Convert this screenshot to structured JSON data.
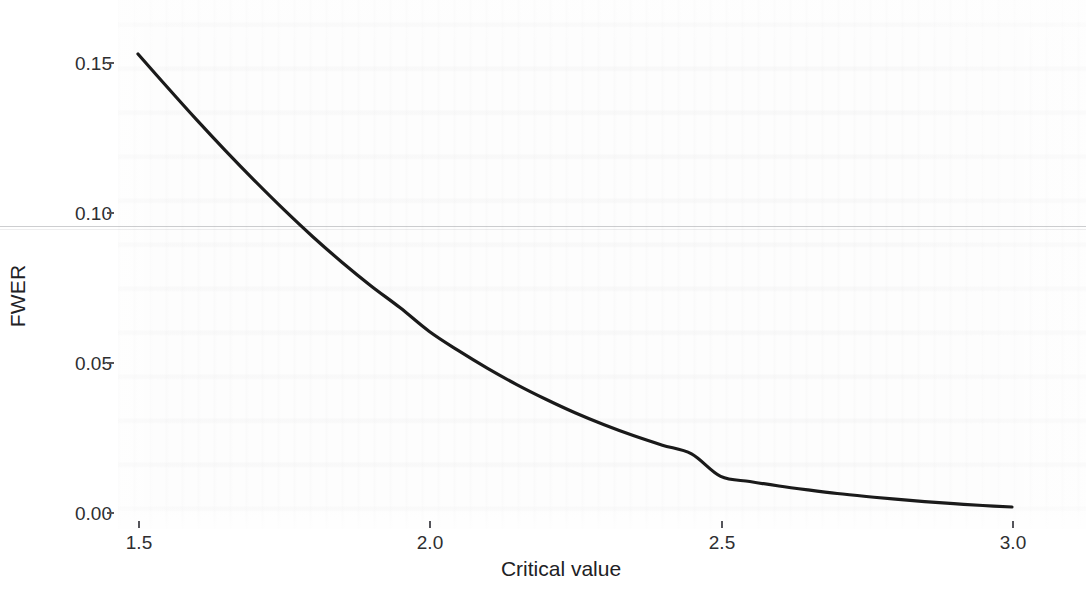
{
  "chart_data": {
    "type": "line",
    "title": "",
    "subtitle": "",
    "xlabel": "Critical value",
    "ylabel": "FWER",
    "xlim": [
      1.45,
      3.05
    ],
    "ylim": [
      0.0,
      0.16
    ],
    "xticks": [
      "1.5",
      "2.0",
      "2.5",
      "3.0"
    ],
    "xtick_values": [
      1.5,
      2.0,
      2.5,
      3.0
    ],
    "yticks": [
      "0.00",
      "0.05",
      "0.10",
      "0.15"
    ],
    "ytick_values": [
      0.0,
      0.05,
      0.1,
      0.15
    ],
    "grid": false,
    "legend": null,
    "annotations": [],
    "series": [
      {
        "name": "FWER",
        "color": "#1a1a1a",
        "linewidth": 3.2,
        "x": [
          1.5,
          1.55,
          1.6,
          1.65,
          1.7,
          1.75,
          1.8,
          1.85,
          1.9,
          1.95,
          2.0,
          2.05,
          2.1,
          2.15,
          2.2,
          2.25,
          2.3,
          2.35,
          2.4,
          2.45,
          2.5,
          2.55,
          2.6,
          2.65,
          2.7,
          2.75,
          2.8,
          2.85,
          2.9,
          2.95,
          3.0
        ],
        "values": [
          0.153,
          0.142,
          0.1312,
          0.1208,
          0.1108,
          0.1012,
          0.0921,
          0.0836,
          0.0757,
          0.0684,
          0.0605,
          0.0541,
          0.0482,
          0.0428,
          0.0379,
          0.0334,
          0.0294,
          0.0258,
          0.0226,
          0.0197,
          0.0122,
          0.0105,
          0.009,
          0.0077,
          0.0065,
          0.0055,
          0.0046,
          0.0038,
          0.0031,
          0.0025,
          0.002
        ]
      }
    ]
  },
  "axes": {
    "y_title": "FWER",
    "x_title": "Critical value"
  },
  "ticks": {
    "y": [
      {
        "label": "0.15",
        "value": 0.15
      },
      {
        "label": "0.10",
        "value": 0.1
      },
      {
        "label": "0.05",
        "value": 0.05
      },
      {
        "label": "0.00",
        "value": 0.0
      }
    ],
    "x": [
      {
        "label": "1.5",
        "value": 1.5
      },
      {
        "label": "2.0",
        "value": 2.0
      },
      {
        "label": "2.5",
        "value": 2.5
      },
      {
        "label": "3.0",
        "value": 3.0
      }
    ]
  },
  "style": {
    "curve_color": "#1a1a1a",
    "tick_color": "#54545a",
    "text_color": "#2e2e30",
    "background_color": "#fdfdfd"
  }
}
